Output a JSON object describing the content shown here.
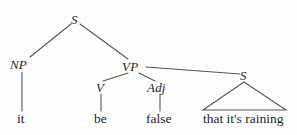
{
  "figure": {
    "type": "syntax-tree",
    "background_color": "#fefefe",
    "line_color": "#555555",
    "text_color": "#252525"
  },
  "nodes": {
    "root": {
      "label": "S",
      "x": 75,
      "y": 20
    },
    "np": {
      "label": "NP",
      "x": 22,
      "y": 65
    },
    "vp": {
      "label": "VP",
      "x": 133,
      "y": 67
    },
    "v": {
      "label": "V",
      "x": 100,
      "y": 88
    },
    "adj": {
      "label": "Adj",
      "x": 158,
      "y": 88
    },
    "embedded_s": {
      "label": "S",
      "x": 244,
      "y": 76
    }
  },
  "terminals": {
    "it": {
      "label": "it",
      "x": 22,
      "y": 119
    },
    "be": {
      "label": "be",
      "x": 101,
      "y": 119
    },
    "false": {
      "label": "false",
      "x": 160,
      "y": 119
    },
    "clause": {
      "label": "that it's raining",
      "x": 244,
      "y": 119
    }
  },
  "edges": [
    {
      "name": "s-to-np",
      "from": "S",
      "to": "NP"
    },
    {
      "name": "s-to-vp",
      "from": "S",
      "to": "VP"
    },
    {
      "name": "np-to-it",
      "from": "NP",
      "to": "it"
    },
    {
      "name": "vp-to-v",
      "from": "VP",
      "to": "V"
    },
    {
      "name": "vp-to-adj",
      "from": "VP",
      "to": "Adj"
    },
    {
      "name": "vp-to-embedded-s",
      "from": "VP",
      "to": "S"
    },
    {
      "name": "v-to-be",
      "from": "V",
      "to": "be"
    },
    {
      "name": "adj-to-false",
      "from": "Adj",
      "to": "false"
    }
  ],
  "triangle": {
    "name": "embedded-clause-triangle",
    "apex_x": 244,
    "apex_y": 82,
    "base_left_x": 203,
    "base_right_x": 286,
    "base_y": 110
  }
}
